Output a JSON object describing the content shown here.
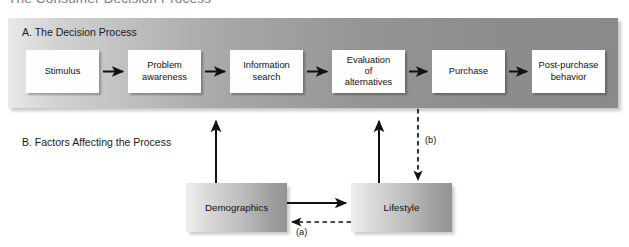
{
  "figure": {
    "title": "The Consumer Decision Process",
    "section_a_label": "A. The Decision Process",
    "section_b_label": "B. Factors Affecting the Process"
  },
  "process_steps": [
    {
      "id": "stimulus",
      "label": "Stimulus"
    },
    {
      "id": "problem",
      "line1": "Problem",
      "line2": "awareness"
    },
    {
      "id": "information",
      "line1": "Information",
      "line2": "search"
    },
    {
      "id": "evaluation",
      "line1": "Evaluation",
      "line2": "of",
      "line3": "alternatives"
    },
    {
      "id": "purchase",
      "label": "Purchase"
    },
    {
      "id": "postpurchase",
      "line1": "Post-purchase",
      "line2": "behavior"
    }
  ],
  "factors": [
    {
      "id": "demographics",
      "label": "Demographics"
    },
    {
      "id": "lifestyle",
      "label": "Lifestyle"
    }
  ],
  "annotations": {
    "a": "(a)",
    "b": "(b)"
  },
  "colors": {
    "panel_light": "#e9e9e9",
    "panel_dark": "#8a8a8a",
    "box_fill": "#fefefe",
    "arrow": "#111111",
    "text": "#111111",
    "title_text": "#7b7b7b"
  }
}
